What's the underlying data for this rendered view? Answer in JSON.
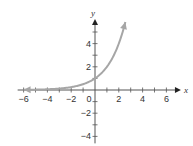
{
  "chart_data": {
    "type": "line",
    "title": "",
    "xlabel": "x",
    "ylabel": "y",
    "xlim": [
      -6.5,
      6.5
    ],
    "ylim": [
      -4.5,
      6
    ],
    "x_ticks": [
      -6,
      -5,
      -4,
      -3,
      -2,
      -1,
      0,
      1,
      2,
      3,
      4,
      5,
      6
    ],
    "x_tick_labels": [
      "-6",
      "-4",
      "-2",
      "0",
      "2",
      "4",
      "6"
    ],
    "x_tick_label_values": [
      -6,
      -4,
      -2,
      0,
      2,
      4,
      6
    ],
    "y_ticks": [
      -4,
      -3,
      -2,
      -1,
      1,
      2,
      3,
      4,
      5
    ],
    "y_tick_labels": [
      "4",
      "2",
      "-2",
      "-4"
    ],
    "y_tick_label_values": [
      4,
      2,
      -2,
      -4
    ],
    "grid": false,
    "series": [
      {
        "name": "y = 2^x",
        "function": "2^x",
        "x_range": [
          -6,
          2.55
        ],
        "points": [
          [
            -6,
            0.016
          ],
          [
            -5,
            0.031
          ],
          [
            -4,
            0.063
          ],
          [
            -3,
            0.125
          ],
          [
            -2,
            0.25
          ],
          [
            -1,
            0.5
          ],
          [
            0,
            1
          ],
          [
            1,
            2
          ],
          [
            2,
            4
          ],
          [
            2.55,
            5.86
          ]
        ],
        "color": "#a6a6a6",
        "arrow_both_ends": true
      }
    ]
  }
}
